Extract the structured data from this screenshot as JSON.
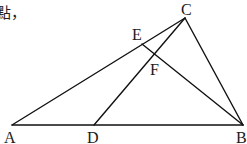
{
  "caption_fragment": "點，",
  "diagram": {
    "type": "geometry-triangle",
    "points": {
      "A": {
        "label": "A",
        "x": 12,
        "y": 125,
        "lx": 4,
        "ly": 143
      },
      "B": {
        "label": "B",
        "x": 243,
        "y": 125,
        "lx": 236,
        "ly": 143
      },
      "C": {
        "label": "C",
        "x": 185,
        "y": 18,
        "lx": 181,
        "ly": 15
      },
      "D": {
        "label": "D",
        "x": 94,
        "y": 125,
        "lx": 87,
        "ly": 143
      },
      "E": {
        "label": "E",
        "x": 142,
        "y": 44,
        "lx": 132,
        "ly": 40
      },
      "F": {
        "label": "F",
        "x": 154,
        "y": 56,
        "lx": 150,
        "ly": 75
      }
    },
    "segments": [
      [
        "A",
        "B"
      ],
      [
        "A",
        "C"
      ],
      [
        "B",
        "C"
      ],
      [
        "C",
        "D"
      ],
      [
        "E",
        "B"
      ]
    ],
    "line_color": "#111111"
  }
}
